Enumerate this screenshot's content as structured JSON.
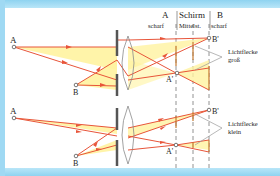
{
  "header": {
    "col_a": "A",
    "col_a_sub": "scharf",
    "col_screen": "Schirm",
    "col_screen_sub": "Mittelst.",
    "col_b": "B",
    "col_b_sub": "scharf"
  },
  "top_diagram": {
    "point_a": "A",
    "point_b": "B",
    "image_a": "A'",
    "image_b": "B'",
    "note_line1": "Lichtflecke",
    "note_line2": "groß"
  },
  "bottom_diagram": {
    "point_a": "A",
    "point_b": "B",
    "image_a": "A'",
    "image_b": "B'",
    "note_line1": "Lichtflecke",
    "note_line2": "klein"
  },
  "colors": {
    "ray": "#e8553a",
    "beam_fill": "#fff3a0",
    "aperture": "#555555",
    "lens": "#8a8a8a",
    "dashed": "#777777",
    "frame": "#9fd9f3"
  }
}
